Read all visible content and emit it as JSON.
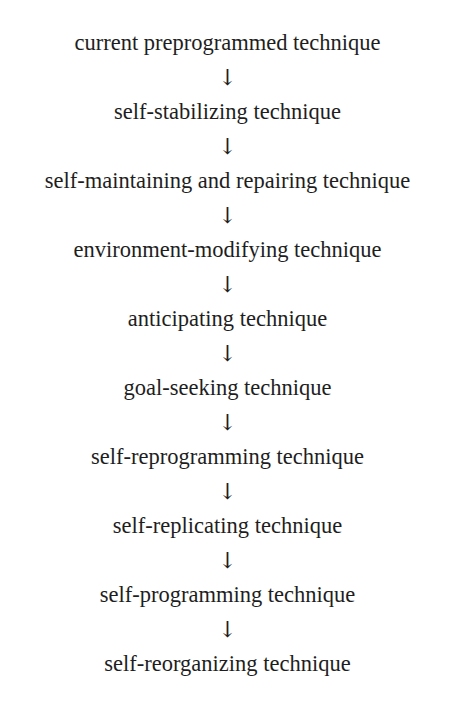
{
  "diagram": {
    "type": "vertical-flow",
    "connector_glyph": "↓",
    "steps": [
      {
        "label": "current preprogrammed technique"
      },
      {
        "label": "self-stabilizing technique"
      },
      {
        "label": "self-maintaining and repairing technique"
      },
      {
        "label": "environment-modifying technique"
      },
      {
        "label": "anticipating technique"
      },
      {
        "label": "goal-seeking technique"
      },
      {
        "label": "self-reprogramming technique"
      },
      {
        "label": "self-replicating technique"
      },
      {
        "label": "self-programming technique"
      },
      {
        "label": "self-reorganizing technique"
      }
    ]
  }
}
